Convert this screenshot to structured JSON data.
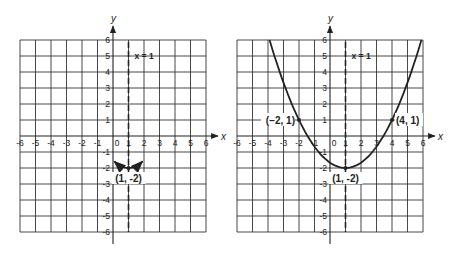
{
  "graphs": [
    {
      "id": "left",
      "x_axis_label": "x",
      "y_axis_label": "y",
      "x_ticks": [
        "-6",
        "-5",
        "-4",
        "-3",
        "-2",
        "-1",
        "0",
        "1",
        "2",
        "3",
        "4",
        "5",
        "6"
      ],
      "y_ticks": [
        "6",
        "5",
        "4",
        "3",
        "2",
        "1",
        "-1",
        "-2",
        "-3",
        "-4",
        "-5",
        "-6"
      ],
      "axis_of_symmetry_label": "x = 1",
      "vertex_label": "(1, -2)"
    },
    {
      "id": "right",
      "x_axis_label": "x",
      "y_axis_label": "y",
      "x_ticks": [
        "-6",
        "-5",
        "-4",
        "-3",
        "-2",
        "-1",
        "0",
        "1",
        "2",
        "3",
        "4",
        "5",
        "6"
      ],
      "y_ticks": [
        "6",
        "5",
        "4",
        "3",
        "2",
        "1",
        "-1",
        "-2",
        "-3",
        "-4",
        "-5",
        "-6"
      ],
      "axis_of_symmetry_label": "x = 1",
      "vertex_label": "(1, -2)",
      "point_left_label": "(−2, 1)",
      "point_right_label": "(4, 1)"
    }
  ],
  "chart_data": [
    {
      "type": "line",
      "title": "",
      "xlabel": "x",
      "ylabel": "y",
      "xlim": [
        -6,
        6
      ],
      "ylim": [
        -6,
        6
      ],
      "grid": true,
      "annotations": [
        "x=1 (dashed axis of symmetry)",
        "(1, -2) vertex"
      ],
      "series": [
        {
          "name": "vertex arc",
          "x": [
            0,
            0.5,
            1,
            1.5,
            2
          ],
          "y": [
            -1.5,
            -1.875,
            -2,
            -1.875,
            -1.5
          ]
        }
      ]
    },
    {
      "type": "line",
      "title": "",
      "xlabel": "x",
      "ylabel": "y",
      "xlim": [
        -6,
        6
      ],
      "ylim": [
        -6,
        6
      ],
      "grid": true,
      "annotations": [
        "x=1 (dashed axis of symmetry)",
        "(1, -2) vertex",
        "(-2, 1)",
        "(4, 1)"
      ],
      "series": [
        {
          "name": "y = (1/3)(x-1)^2 - 2",
          "x": [
            -3.9,
            -2,
            0,
            1,
            2,
            4,
            5.9
          ],
          "y": [
            6,
            1,
            -1.67,
            -2,
            -1.67,
            1,
            6
          ]
        }
      ]
    }
  ]
}
